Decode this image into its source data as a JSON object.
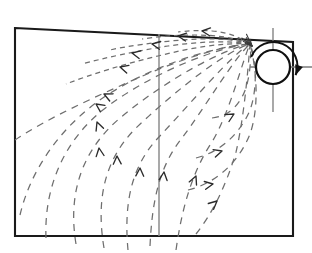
{
  "figure": {
    "title": "Vortex induced flow field",
    "type": "flow-field-diagram",
    "background_color": "#ffffff",
    "line_color": "#1a1a1a",
    "streamline_color": "#6e6e6e",
    "divider_color": "#8d8d8d",
    "canvas": {
      "width": 312,
      "height": 253
    }
  },
  "domain_boundary": {
    "name": "domain-outline",
    "shape": "quadrilateral",
    "stroke_width": 2.1,
    "vertices": [
      {
        "label": "top-left",
        "x": 15,
        "y": 28
      },
      {
        "label": "top-right",
        "x": 293,
        "y": 42
      },
      {
        "label": "bottom-right",
        "x": 293,
        "y": 236
      },
      {
        "label": "bottom-left",
        "x": 15,
        "y": 236
      }
    ]
  },
  "divider": {
    "name": "vertical-divider",
    "orientation": "vertical",
    "x": 159,
    "y_top": 34,
    "y_bottom": 236,
    "color": "#8d8d8d"
  },
  "vortex": {
    "name": "point-vortex",
    "center_x": 273,
    "center_y": 67,
    "radius": 17,
    "rotation_sense": "clockwise",
    "circulation_arc": {
      "radius": 24,
      "start_angle_deg": 205,
      "end_angle_deg": 20
    },
    "crosshair": {
      "vertical_y_top": 28,
      "vertical_y_bottom": 112,
      "horizontal_x_left": 250,
      "horizontal_x_right": 312,
      "color": "#7a7a7a"
    }
  },
  "stagnation_point": {
    "name": "stagnation-burst",
    "x": 252,
    "y": 46,
    "ray_count": 7
  },
  "chart_data": {
    "type": "line",
    "title": "Vortex induced flow field",
    "xlabel": "",
    "ylabel": "",
    "grid": false,
    "legend": "none",
    "xlim": [
      0,
      312
    ],
    "ylim": [
      0,
      253
    ],
    "series": [
      {
        "name": "streamline-left-1",
        "group": "left-deflected",
        "arrow_direction": "down-left",
        "path": "M 15,140 C 48,118 96,96 152,72 C 200,52 236,44 250,44",
        "arrows": [
          {
            "x": 104,
            "y": 94,
            "angle_deg": 205
          }
        ]
      },
      {
        "name": "streamline-left-2",
        "group": "left-deflected",
        "arrow_direction": "down-left",
        "path": "M 20,215 C 30,172 60,124 112,92 C 168,58 228,45 250,44",
        "arrows": [
          {
            "x": 96,
            "y": 104,
            "angle_deg": 215
          }
        ]
      },
      {
        "name": "streamline-left-3",
        "group": "left-deflected",
        "arrow_direction": "down",
        "path": "M 46,238 C 44,190 62,140 108,106 C 160,68 224,46 250,44",
        "arrows": [
          {
            "x": 97,
            "y": 122,
            "angle_deg": 250
          }
        ]
      },
      {
        "name": "streamline-left-4",
        "group": "left-deflected",
        "arrow_direction": "down",
        "path": "M 76,244 C 68,196 80,152 120,118 C 168,78 226,48 250,44",
        "arrows": [
          {
            "x": 99,
            "y": 148,
            "angle_deg": 262
          }
        ]
      },
      {
        "name": "streamline-left-5",
        "group": "left-deflected",
        "arrow_direction": "down",
        "path": "M 104,248 C 96,200 104,160 136,128 C 178,88 228,50 250,44",
        "arrows": [
          {
            "x": 117,
            "y": 156,
            "angle_deg": 268
          }
        ]
      },
      {
        "name": "streamline-left-6",
        "group": "left-deflected",
        "arrow_direction": "down",
        "path": "M 128,250 C 124,206 130,168 158,138 C 192,102 232,54 250,44",
        "arrows": [
          {
            "x": 140,
            "y": 168,
            "angle_deg": 272
          }
        ]
      },
      {
        "name": "streamline-center-1",
        "group": "center",
        "arrow_direction": "down",
        "path": "M 150,246 C 152,204 158,168 182,138 C 206,106 234,58 250,44",
        "arrows": [
          {
            "x": 164,
            "y": 172,
            "angle_deg": 276
          }
        ]
      },
      {
        "name": "streamline-center-2",
        "group": "center",
        "arrow_direction": "down-right",
        "path": "M 176,250 C 182,208 192,172 212,142 C 230,112 242,62 250,44",
        "arrows": [
          {
            "x": 196,
            "y": 176,
            "angle_deg": 293
          }
        ]
      },
      {
        "name": "streamline-right-1",
        "group": "right-wrapped",
        "arrow_direction": "down-right",
        "path": "M 196,234 C 212,214 226,186 236,152 C 244,118 248,70 250,44",
        "arrows": [
          {
            "x": 217,
            "y": 201,
            "angle_deg": 318
          }
        ]
      },
      {
        "name": "streamline-right-2",
        "group": "right-wrapped",
        "arrow_direction": "right",
        "path": "M 188,190 C 214,184 238,164 250,134 C 260,106 256,66 250,44",
        "arrows": [
          {
            "x": 213,
            "y": 184,
            "angle_deg": 350
          }
        ]
      },
      {
        "name": "streamline-right-3",
        "group": "right-wrapped",
        "arrow_direction": "right",
        "path": "M 196,158 C 220,152 240,134 250,110 C 258,88 256,58 250,44",
        "arrows": [
          {
            "x": 222,
            "y": 151,
            "angle_deg": 343
          }
        ]
      },
      {
        "name": "streamline-right-4",
        "group": "right-wrapped",
        "arrow_direction": "down-right",
        "path": "M 212,118 C 232,116 244,100 248,80 C 251,66 251,52 250,44",
        "arrows": [
          {
            "x": 234,
            "y": 114,
            "angle_deg": 330
          }
        ]
      },
      {
        "name": "streamline-upper-fan-1",
        "group": "upper-fan",
        "arrow_direction": "left",
        "path": "M 250,44 C 224,42 190,48 158,56 C 124,64 92,74 66,84",
        "arrows": [
          {
            "x": 120,
            "y": 67,
            "angle_deg": 196
          }
        ]
      },
      {
        "name": "streamline-upper-fan-2",
        "group": "upper-fan",
        "arrow_direction": "left",
        "path": "M 250,44 C 226,40 196,42 168,46 C 136,51 104,58 82,64",
        "arrows": [
          {
            "x": 132,
            "y": 53,
            "angle_deg": 192
          }
        ]
      },
      {
        "name": "streamline-upper-fan-3",
        "group": "upper-fan",
        "arrow_direction": "left",
        "path": "M 250,44 C 230,38 206,38 182,40 C 156,42 128,46 110,50",
        "arrows": [
          {
            "x": 152,
            "y": 44,
            "angle_deg": 190
          }
        ]
      },
      {
        "name": "streamline-upper-fan-4",
        "group": "upper-fan",
        "arrow_direction": "left",
        "path": "M 250,44 C 234,37 214,35 194,35 C 174,35 156,37 142,39",
        "arrows": [
          {
            "x": 178,
            "y": 36,
            "angle_deg": 188
          }
        ]
      },
      {
        "name": "streamline-upper-fan-5",
        "group": "upper-fan",
        "arrow_direction": "left",
        "path": "M 250,44 C 238,36 226,32 212,31 C 198,30 186,31 178,32",
        "arrows": [
          {
            "x": 202,
            "y": 31,
            "angle_deg": 186
          }
        ]
      }
    ]
  },
  "legend_items": [],
  "annotations": []
}
